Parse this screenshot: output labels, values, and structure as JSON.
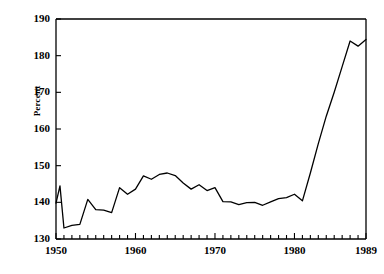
{
  "chart_data": {
    "type": "line",
    "title": "",
    "xlabel": "",
    "ylabel": "Percent",
    "xlim": [
      1950,
      1989
    ],
    "ylim": [
      130,
      190
    ],
    "grid": false,
    "legend": null,
    "y_ticks": [
      130,
      140,
      150,
      160,
      170,
      180,
      190
    ],
    "y_tick_labels": [
      "130",
      "140",
      "150",
      "160",
      "170",
      "180",
      "190"
    ],
    "x_ticks": [
      1950,
      1960,
      1970,
      1980,
      1989
    ],
    "x_tick_labels": [
      "1950",
      "1960",
      "1970",
      "1980",
      "1989"
    ],
    "x_minor_tick_interval": 1,
    "line_color": "#000000",
    "x": [
      1950,
      1950.5,
      1951,
      1952,
      1953,
      1954,
      1955,
      1956,
      1957,
      1958,
      1959,
      1960,
      1961,
      1962,
      1963,
      1964,
      1965,
      1966,
      1967,
      1968,
      1969,
      1970,
      1971,
      1972,
      1973,
      1974,
      1975,
      1976,
      1977,
      1978,
      1979,
      1980,
      1981,
      1982,
      1983,
      1984,
      1985,
      1986,
      1987,
      1988,
      1989
    ],
    "values": [
      139.8,
      144.5,
      133.0,
      133.7,
      134.0,
      140.8,
      138.0,
      137.9,
      137.2,
      144.0,
      142.2,
      143.6,
      147.2,
      146.3,
      147.6,
      148.0,
      147.3,
      145.3,
      143.6,
      144.8,
      143.2,
      144.0,
      140.2,
      140.1,
      139.4,
      139.9,
      140.0,
      139.2,
      140.1,
      141.0,
      141.3,
      142.2,
      140.4,
      148.0,
      156.0,
      163.5,
      170.0,
      177.0,
      184.0,
      182.6,
      184.4
    ]
  },
  "axis": {
    "y_label": "Percent"
  }
}
